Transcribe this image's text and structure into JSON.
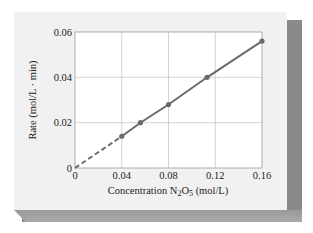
{
  "chart_data": {
    "type": "line",
    "title": "",
    "xlabel": "Concentration N2O5 (mol/L)",
    "xlabel_parts": {
      "pre": "Concentration N",
      "sub1": "2",
      "mid": "O",
      "sub2": "5",
      "post": " (mol/L)"
    },
    "ylabel": "Rate (mol/L · min)",
    "xlim": [
      0,
      0.16
    ],
    "ylim": [
      0,
      0.06
    ],
    "x_ticks": [
      "0",
      "0.04",
      "0.08",
      "0.12",
      "0.16"
    ],
    "y_ticks": [
      "0",
      "0.02",
      "0.04",
      "0.06"
    ],
    "grid": true,
    "legend": null,
    "series": [
      {
        "name": "Rate vs concentration",
        "x": [
          0.04,
          0.056,
          0.08,
          0.113,
          0.16
        ],
        "y": [
          0.014,
          0.02,
          0.028,
          0.04,
          0.056
        ],
        "style": "solid line with markers"
      },
      {
        "name": "extrapolation to origin",
        "x": [
          0,
          0.04
        ],
        "y": [
          0,
          0.014
        ],
        "style": "dashed"
      }
    ],
    "colors": {
      "line": "#6a6a6a",
      "grid": "#c8c8c8",
      "card": "#f1f1f1",
      "plot_bg": "#ffffff",
      "shadow": "#8a8a8a"
    }
  }
}
